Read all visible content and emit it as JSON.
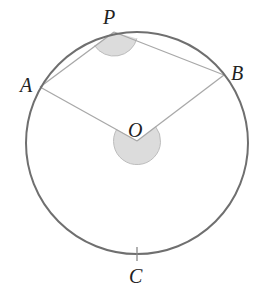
{
  "diagram": {
    "type": "circle-geometry",
    "colors": {
      "circle": "#6f6f6f",
      "chords": "#a8a8a8",
      "shade": "#dcdcdc",
      "shade_edge": "#b5b5b5",
      "label": "#222222"
    },
    "circle": {
      "cx": 137,
      "cy": 143,
      "r": 111
    },
    "points": {
      "P": {
        "label": "P",
        "x": 114,
        "y": 32,
        "lx": 103,
        "ly": 24
      },
      "A": {
        "label": "A",
        "x": 40,
        "y": 87,
        "lx": 20,
        "ly": 92
      },
      "B": {
        "label": "B",
        "x": 224,
        "y": 75,
        "lx": 231,
        "ly": 80
      },
      "O": {
        "label": "O",
        "x": 137,
        "y": 141,
        "lx": 128,
        "ly": 137
      },
      "C": {
        "label": "C",
        "x": 137,
        "y": 254,
        "lx": 129,
        "ly": 283
      }
    },
    "segments": [
      {
        "from": "P",
        "to": "A"
      },
      {
        "from": "P",
        "to": "B"
      },
      {
        "from": "O",
        "to": "A"
      },
      {
        "from": "O",
        "to": "B"
      }
    ],
    "shaded_angles": [
      {
        "vertex": "P",
        "description": "inscribed angle APB"
      },
      {
        "vertex": "O",
        "description": "reflex angle AOB"
      }
    ],
    "tick_mark": {
      "at": "C"
    }
  }
}
